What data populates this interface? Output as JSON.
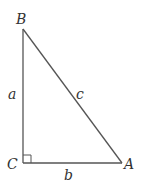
{
  "figure": {
    "type": "right-triangle",
    "stroke_color": "#555555",
    "label_color": "#333333",
    "vertices": {
      "B": {
        "label": "B",
        "x": 23,
        "y": 29
      },
      "C": {
        "label": "C",
        "x": 23,
        "y": 163
      },
      "A": {
        "label": "A",
        "x": 122,
        "y": 163
      }
    },
    "sides": {
      "a": {
        "label": "a",
        "from": "B",
        "to": "C"
      },
      "b": {
        "label": "b",
        "from": "C",
        "to": "A"
      },
      "c": {
        "label": "c",
        "from": "B",
        "to": "A"
      }
    },
    "right_angle_at": "C"
  }
}
